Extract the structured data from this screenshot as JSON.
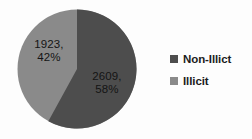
{
  "chart_data": {
    "type": "pie",
    "title": "",
    "subtitle": "",
    "xlabel": "",
    "ylabel": "",
    "grid": false,
    "legend_position": "right",
    "categories": [
      "Non-Illict",
      "Illicit"
    ],
    "values": [
      2609,
      1923
    ],
    "percentages": [
      58,
      42
    ],
    "total": 4532,
    "start_angle_deg": 0,
    "direction": "clockwise",
    "slices": [
      {
        "name": "Non-Illict",
        "value": 2609,
        "percent": 58,
        "label": "2609, 58%",
        "label_value": "2609,",
        "label_percent": "58%",
        "color": "#4d4d4d",
        "start_deg": 0,
        "end_deg": 208.8
      },
      {
        "name": "Illicit",
        "value": 1923,
        "percent": 42,
        "label": "1923, 42%",
        "label_value": "1923,",
        "label_percent": "42%",
        "color": "#8a8a8a",
        "start_deg": 208.8,
        "end_deg": 360
      }
    ],
    "legend": [
      {
        "label": "Non-Illict",
        "color": "#4d4d4d"
      },
      {
        "label": "Illicit",
        "color": "#8a8a8a"
      }
    ]
  },
  "colors": {
    "background": "#fdfdfd",
    "slice_dark": "#4d4d4d",
    "slice_light": "#8a8a8a",
    "label_text": "#141414",
    "legend_text": "#1c1c1c"
  }
}
